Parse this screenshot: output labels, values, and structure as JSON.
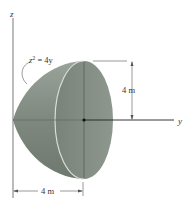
{
  "figure": {
    "axes": {
      "z_label": "z",
      "y_label": "y"
    },
    "curve_equation": {
      "base": "z",
      "exponent": "2",
      "rhs": " = 4y"
    },
    "dimensions": {
      "height": "4 m",
      "length": "4 m"
    },
    "colors": {
      "solid_fill": "#7f887f",
      "face_fill": "#848d84",
      "edge_highlight": "#d8ddd6",
      "line": "#333333"
    }
  }
}
